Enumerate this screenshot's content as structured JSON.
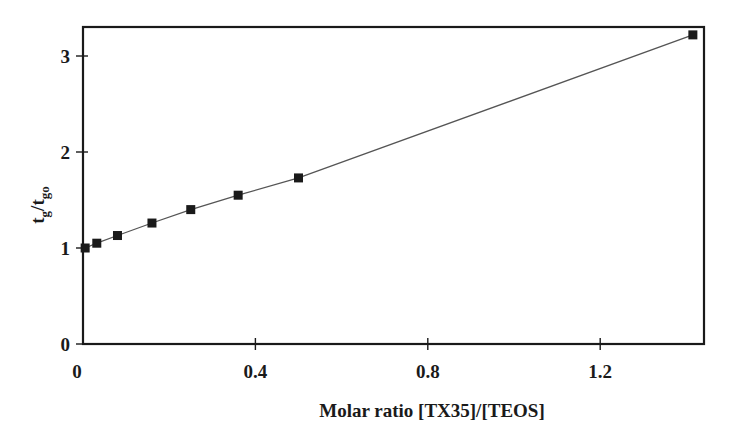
{
  "chart_data": {
    "type": "line",
    "title": "",
    "xlabel": "Molar ratio [TX35]/[TEOS]",
    "ylabel": "tg/tgo",
    "ylabel_parts": {
      "main1": "t",
      "sub1": "g",
      "slash": "/",
      "main2": "t",
      "sub2": "go"
    },
    "xlim": [
      0,
      1.45
    ],
    "ylim": [
      0,
      3.3
    ],
    "xticks": [
      0,
      0.4,
      0.8,
      1.2
    ],
    "xtick_labels": [
      "0",
      "0.4",
      "0.8",
      "1.2"
    ],
    "yticks": [
      0,
      1,
      2,
      3
    ],
    "ytick_labels": [
      "0",
      "1",
      "2",
      "3"
    ],
    "grid": false,
    "legend": null,
    "marker": "square",
    "colors": {
      "line": "#555555",
      "marker": "#1a1a1a",
      "axis": "#1a1a1a"
    },
    "series": [
      {
        "name": "tg/tgo",
        "x": [
          0.005,
          0.032,
          0.08,
          0.16,
          0.25,
          0.36,
          0.5,
          1.415
        ],
        "y": [
          1.0,
          1.05,
          1.13,
          1.26,
          1.4,
          1.55,
          1.73,
          3.22
        ]
      }
    ]
  }
}
